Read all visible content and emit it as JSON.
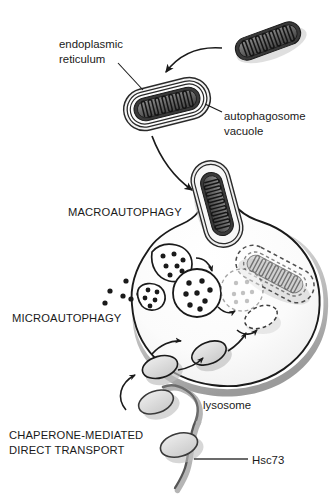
{
  "figure": {
    "background_color": "#ffffff",
    "ink_color": "#1a1a1a"
  },
  "labels": {
    "endoplasmic_reticulum_line1": "endoplasmic",
    "endoplasmic_reticulum_line2": "reticulum",
    "autophagosome_line1": "autophagosome",
    "autophagosome_line2": "vacuole",
    "macroautophagy": "MACROAUTOPHAGY",
    "microautophagy": "MICROAUTOPHAGY",
    "lysosome": "lysosome",
    "cma_line1": "CHAPERONE-MEDIATED",
    "cma_line2": "DIRECT TRANSPORT",
    "hsc73": "Hsc73"
  },
  "structures": {
    "free_mitochondrion": "mitochondrion-free",
    "engulfed_mitochondrion": "mitochondrion-wrapped-by-er",
    "fusing_mitochondrion": "autophagosome-fusing-with-lysosome",
    "degrading_mitochondrion": "mitochondrion-degrading-dashed",
    "lysosome_body": "lysosome",
    "invagination_left": "microautophagy-invagination",
    "invagination_upper": "microautophagy-invagination",
    "internal_vesicle": "internalized-vesicle-with-cargo",
    "degrading_vesicle": "vesicle-degrading-dashed",
    "degrading_ellipse": "protein-degrading-dashed",
    "cma_substrate_outer": "cma-substrate-protein",
    "cma_substrate_membrane": "cma-substrate-at-membrane",
    "cma_substrate_internal": "cma-substrate-translocated",
    "chaperone_strand": "hsc73-chaperone-strand"
  },
  "colors": {
    "outline": "#1a1a1a",
    "membrane_dark": "#3c3c3c",
    "membrane_mid": "#6f6f6f",
    "membrane_light": "#a8a8a8",
    "fill_light": "#f2f2f2",
    "fill_grey": "#d6d6d6",
    "shadow": "#bdbdbd",
    "faded": "#cfcfcf"
  }
}
